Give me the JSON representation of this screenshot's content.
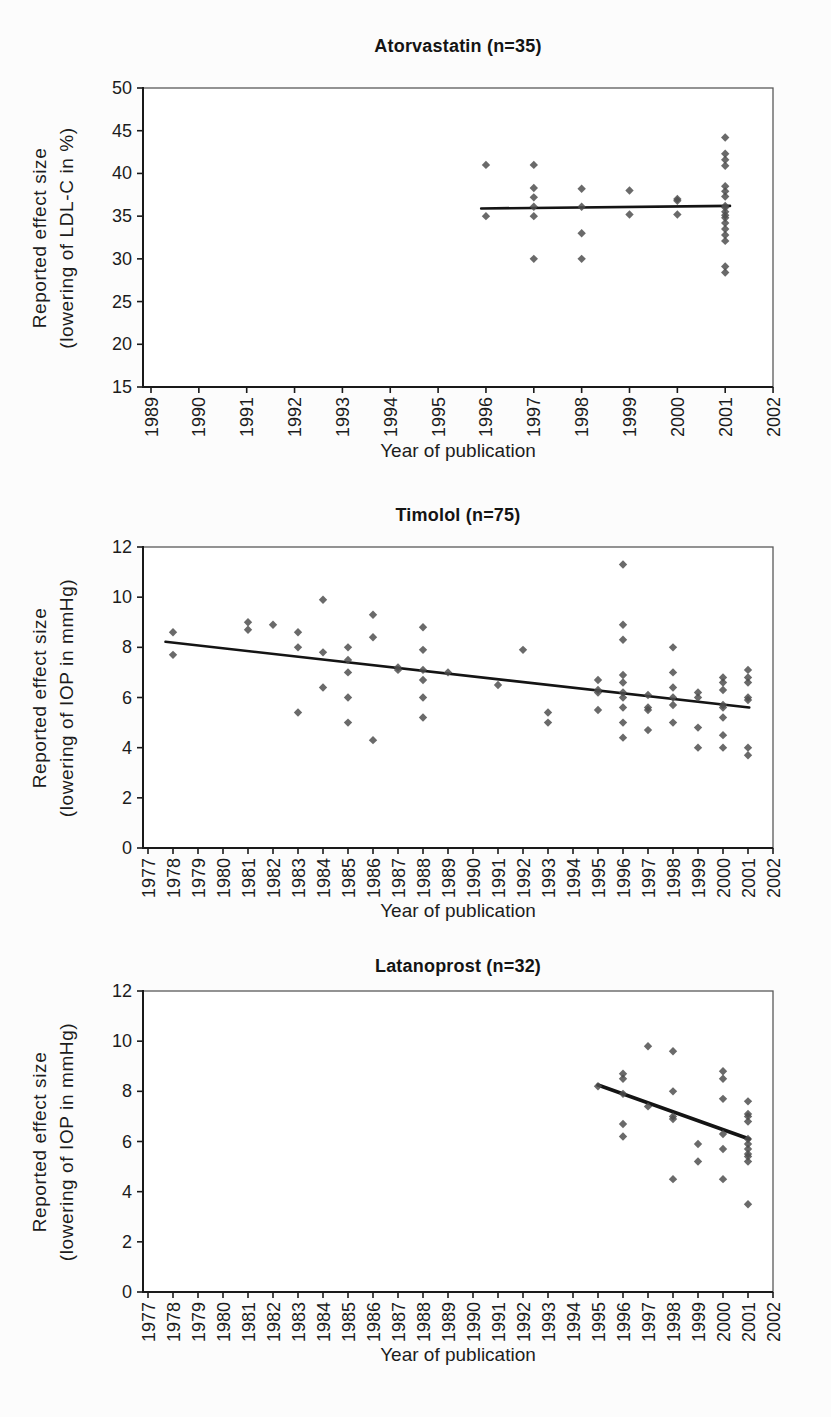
{
  "style": {
    "page_background": "#fcfcfc",
    "plot_background": "#ffffff",
    "marker_color": "#4d4d4d",
    "trend_color": "#141414",
    "axis_color": "#1a1a1a",
    "box_color": "#5a5a5a",
    "text_color": "#1c1c1c"
  },
  "chart_data": [
    {
      "id": "atorvastatin",
      "type": "scatter",
      "title": "Atorvastatin (n=35)",
      "ylabel_line1": "Reported effect size",
      "ylabel_line2": "(lowering of LDL-C in %)",
      "xlabel": "Year of publication",
      "x_ticks": [
        1989,
        1990,
        1991,
        1992,
        1993,
        1994,
        1995,
        1996,
        1997,
        1998,
        1999,
        2000,
        2001,
        2002
      ],
      "y_ticks": [
        15,
        20,
        25,
        30,
        35,
        40,
        45,
        50
      ],
      "ylim": [
        15,
        50
      ],
      "points": [
        [
          1996,
          41
        ],
        [
          1996,
          35
        ],
        [
          1997,
          41
        ],
        [
          1997,
          38.3
        ],
        [
          1997,
          37.2
        ],
        [
          1997,
          36.1
        ],
        [
          1997,
          35
        ],
        [
          1997,
          30
        ],
        [
          1998,
          38.2
        ],
        [
          1998,
          36.1
        ],
        [
          1998,
          33
        ],
        [
          1998,
          30
        ],
        [
          1999,
          38
        ],
        [
          1999,
          35.2
        ],
        [
          2000,
          37
        ],
        [
          2000,
          36.8
        ],
        [
          2000,
          35.2
        ],
        [
          2001,
          44.2
        ],
        [
          2001,
          42.3
        ],
        [
          2001,
          41.6
        ],
        [
          2001,
          40.9
        ],
        [
          2001,
          38.5
        ],
        [
          2001,
          37.9
        ],
        [
          2001,
          37.3
        ],
        [
          2001,
          36.2
        ],
        [
          2001,
          36
        ],
        [
          2001,
          35.5
        ],
        [
          2001,
          35.1
        ],
        [
          2001,
          34.8
        ],
        [
          2001,
          34.2
        ],
        [
          2001,
          33.5
        ],
        [
          2001,
          32.8
        ],
        [
          2001,
          32.1
        ],
        [
          2001,
          29.1
        ],
        [
          2001,
          28.4
        ]
      ],
      "trend": [
        1995.9,
        35.9,
        2001.1,
        36.2
      ],
      "layout": {
        "plot_top": 88,
        "plot_bottom": 387,
        "plot_left": 143,
        "plot_right": 773,
        "x_first": 151,
        "x_step": 47.85,
        "trend_width": 2.6
      }
    },
    {
      "id": "timolol",
      "type": "scatter",
      "title": "Timolol (n=75)",
      "ylabel_line1": "Reported effect size",
      "ylabel_line2": "(lowering of IOP in mmHg)",
      "xlabel": "Year of publication",
      "x_ticks": [
        1977,
        1978,
        1979,
        1980,
        1981,
        1982,
        1983,
        1984,
        1985,
        1986,
        1987,
        1988,
        1989,
        1990,
        1991,
        1992,
        1993,
        1994,
        1995,
        1996,
        1997,
        1998,
        1999,
        2000,
        2001,
        2002
      ],
      "y_ticks": [
        0,
        2,
        4,
        6,
        8,
        10,
        12
      ],
      "ylim": [
        0,
        12
      ],
      "points": [
        [
          1978,
          8.6
        ],
        [
          1978,
          7.7
        ],
        [
          1981,
          9
        ],
        [
          1981,
          8.7
        ],
        [
          1982,
          8.9
        ],
        [
          1983,
          8.6
        ],
        [
          1983,
          8
        ],
        [
          1983,
          5.4
        ],
        [
          1984,
          9.9
        ],
        [
          1984,
          7.8
        ],
        [
          1984,
          6.4
        ],
        [
          1985,
          8
        ],
        [
          1985,
          7.5
        ],
        [
          1985,
          7
        ],
        [
          1985,
          6
        ],
        [
          1985,
          5
        ],
        [
          1986,
          9.3
        ],
        [
          1986,
          8.4
        ],
        [
          1986,
          4.3
        ],
        [
          1987,
          7.2
        ],
        [
          1987,
          7.1
        ],
        [
          1988,
          8.8
        ],
        [
          1988,
          7.9
        ],
        [
          1988,
          7.1
        ],
        [
          1988,
          6.7
        ],
        [
          1988,
          6
        ],
        [
          1988,
          5.2
        ],
        [
          1989,
          7
        ],
        [
          1991,
          6.5
        ],
        [
          1992,
          7.9
        ],
        [
          1993,
          5.4
        ],
        [
          1993,
          5
        ],
        [
          1995,
          6.7
        ],
        [
          1995,
          6.3
        ],
        [
          1995,
          6.2
        ],
        [
          1995,
          5.5
        ],
        [
          1996,
          11.3
        ],
        [
          1996,
          8.9
        ],
        [
          1996,
          8.3
        ],
        [
          1996,
          6.9
        ],
        [
          1996,
          6.6
        ],
        [
          1996,
          6.2
        ],
        [
          1996,
          6
        ],
        [
          1996,
          5.6
        ],
        [
          1996,
          5
        ],
        [
          1996,
          4.4
        ],
        [
          1997,
          6.1
        ],
        [
          1997,
          5.6
        ],
        [
          1997,
          5.5
        ],
        [
          1997,
          4.7
        ],
        [
          1998,
          8
        ],
        [
          1998,
          7
        ],
        [
          1998,
          6.4
        ],
        [
          1998,
          6
        ],
        [
          1998,
          5.7
        ],
        [
          1998,
          5
        ],
        [
          1999,
          6.2
        ],
        [
          1999,
          6
        ],
        [
          1999,
          4.8
        ],
        [
          1999,
          4
        ],
        [
          2000,
          6.8
        ],
        [
          2000,
          6.6
        ],
        [
          2000,
          6.3
        ],
        [
          2000,
          5.7
        ],
        [
          2000,
          5.6
        ],
        [
          2000,
          5.2
        ],
        [
          2000,
          4.5
        ],
        [
          2000,
          4
        ],
        [
          2001,
          7.1
        ],
        [
          2001,
          6.8
        ],
        [
          2001,
          6.6
        ],
        [
          2001,
          6
        ],
        [
          2001,
          5.9
        ],
        [
          2001,
          4
        ],
        [
          2001,
          3.7
        ]
      ],
      "trend": [
        1977.7,
        8.22,
        2001.05,
        5.6
      ],
      "layout": {
        "plot_top": 547,
        "plot_bottom": 848,
        "plot_left": 143,
        "plot_right": 773,
        "x_first": 148,
        "x_step": 25,
        "trend_width": 2.6
      }
    },
    {
      "id": "latanoprost",
      "type": "scatter",
      "title": "Latanoprost (n=32)",
      "ylabel_line1": "Reported effect size",
      "ylabel_line2": "(lowering of IOP in mmHg)",
      "xlabel": "Year of publication",
      "x_ticks": [
        1977,
        1978,
        1979,
        1980,
        1981,
        1982,
        1983,
        1984,
        1985,
        1986,
        1987,
        1988,
        1989,
        1990,
        1991,
        1992,
        1993,
        1994,
        1995,
        1996,
        1997,
        1998,
        1999,
        2000,
        2001,
        2002
      ],
      "y_ticks": [
        0,
        2,
        4,
        6,
        8,
        10,
        12
      ],
      "ylim": [
        0,
        12
      ],
      "points": [
        [
          1995,
          8.2
        ],
        [
          1996,
          8.7
        ],
        [
          1996,
          8.5
        ],
        [
          1996,
          7.9
        ],
        [
          1996,
          6.7
        ],
        [
          1996,
          6.2
        ],
        [
          1997,
          9.8
        ],
        [
          1997,
          7.4
        ],
        [
          1998,
          9.6
        ],
        [
          1998,
          8
        ],
        [
          1998,
          7
        ],
        [
          1998,
          6.9
        ],
        [
          1998,
          4.5
        ],
        [
          1999,
          5.9
        ],
        [
          1999,
          5.2
        ],
        [
          2000,
          8.8
        ],
        [
          2000,
          8.5
        ],
        [
          2000,
          7.7
        ],
        [
          2000,
          6.3
        ],
        [
          2000,
          5.7
        ],
        [
          2000,
          4.5
        ],
        [
          2001,
          7.6
        ],
        [
          2001,
          7.1
        ],
        [
          2001,
          7
        ],
        [
          2001,
          6.8
        ],
        [
          2001,
          6.1
        ],
        [
          2001,
          5.9
        ],
        [
          2001,
          5.7
        ],
        [
          2001,
          5.5
        ],
        [
          2001,
          5.4
        ],
        [
          2001,
          5.2
        ],
        [
          2001,
          3.5
        ]
      ],
      "trend": [
        1995,
        8.25,
        2001.05,
        6.1
      ],
      "layout": {
        "plot_top": 991,
        "plot_bottom": 1292,
        "plot_left": 143,
        "plot_right": 773,
        "x_first": 148,
        "x_step": 25,
        "trend_width": 3.6
      }
    }
  ]
}
